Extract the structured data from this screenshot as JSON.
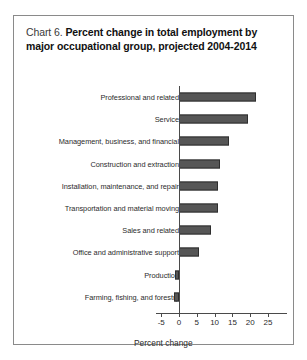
{
  "chart_data": {
    "type": "bar",
    "orientation": "horizontal",
    "title_prefix": "Chart 6.",
    "title": "Percent change in total employment by major occupational group, projected 2004-2014",
    "xlabel": "Percent change",
    "ylabel": "",
    "xlim": [
      -5,
      25
    ],
    "xticks": [
      -5,
      0,
      5,
      10,
      15,
      20,
      25
    ],
    "xtick_labels": [
      "-5",
      "0",
      "5",
      "10",
      "15",
      "20",
      "25"
    ],
    "grid": false,
    "legend": false,
    "bar_color": "#565656",
    "bar_edge_color": "#2e2e2e",
    "categories": [
      "Professional and related",
      "Service",
      "Management, business, and financial",
      "Construction and extraction",
      "Installation, maintenance, and repair",
      "Transportation and material moving",
      "Sales and related",
      "Office and administrative support",
      "Production",
      "Farming, fishing, and forestry"
    ],
    "values": [
      21.5,
      19.5,
      14.0,
      11.5,
      11.0,
      11.0,
      9.0,
      5.5,
      -1.0,
      -1.5
    ]
  }
}
